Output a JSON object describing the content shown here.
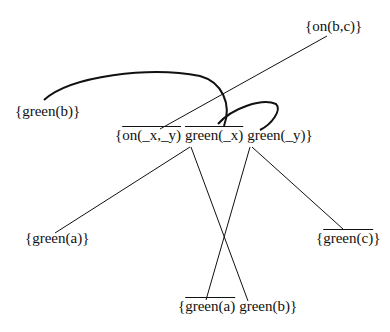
{
  "diagram": {
    "type": "resolution-tree",
    "nodes": {
      "on_bc": {
        "open": "{",
        "literals": [
          {
            "text": "on(b,c)",
            "negated": false
          }
        ],
        "close": "}"
      },
      "green_b": {
        "open": "{",
        "literals": [
          {
            "text": "green(b)",
            "negated": false
          }
        ],
        "close": "}"
      },
      "center": {
        "open": "{",
        "literals": [
          {
            "text": "on(_x,_y)",
            "negated": true
          },
          {
            "text": "green(_x)",
            "negated": true
          },
          {
            "text": "green(_y)",
            "negated": false
          }
        ],
        "close": "}"
      },
      "green_a": {
        "open": "{",
        "literals": [
          {
            "text": "green(a)",
            "negated": false
          }
        ],
        "close": "}"
      },
      "not_green_c": {
        "open": "{",
        "literals": [
          {
            "text": "green(c)",
            "negated": true
          }
        ],
        "close": "}"
      },
      "bottom": {
        "open": "{",
        "literals": [
          {
            "text": "green(a)",
            "negated": true
          },
          {
            "text": "green(b)",
            "negated": false
          }
        ],
        "close": "}"
      }
    },
    "edges": [
      {
        "from": "on_bc",
        "to": "center",
        "style": "straight"
      },
      {
        "from": "green_b",
        "to": "center",
        "style": "curved"
      },
      {
        "from": "center",
        "to": "center",
        "style": "curved-loop"
      },
      {
        "from": "center",
        "to": "green_a",
        "style": "straight"
      },
      {
        "from": "center",
        "to": "bottom",
        "style": "straight"
      },
      {
        "from": "center",
        "to": "bottom",
        "style": "straight"
      },
      {
        "from": "center",
        "to": "not_green_c",
        "style": "straight"
      }
    ],
    "stroke_color": "#111111"
  }
}
